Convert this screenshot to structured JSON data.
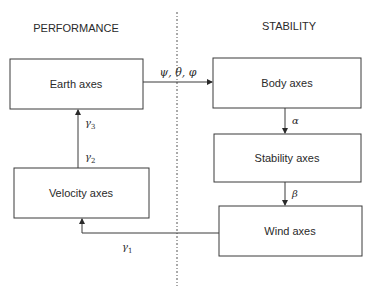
{
  "diagram": {
    "sections": {
      "left": "PERFORMANCE",
      "right": "STABILITY"
    },
    "boxes": {
      "earth": "Earth axes",
      "velocity": "Velocity axes",
      "body": "Body axes",
      "stability": "Stability axes",
      "wind": "Wind axes"
    },
    "edges": {
      "earth_to_body": "ψ, θ, φ",
      "body_to_stability": "α",
      "stability_to_wind": "β",
      "wind_to_velocity": "γ",
      "wind_to_velocity_sub": "1",
      "velocity_to_earth_lower": "γ",
      "velocity_to_earth_lower_sub": "2",
      "velocity_to_earth_upper": "γ",
      "velocity_to_earth_upper_sub": "3"
    },
    "colors": {
      "stroke": "#3a3a3a",
      "text": "#2a2a2a",
      "background": "#ffffff"
    }
  }
}
